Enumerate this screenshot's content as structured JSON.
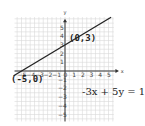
{
  "chart_data": {
    "type": "line",
    "title": "",
    "xlabel": "x",
    "ylabel": "y",
    "xlim": [
      -5,
      5
    ],
    "ylim": [
      -5,
      5
    ],
    "grid": true,
    "x_ticks": [
      -5,
      -4,
      -3,
      -2,
      -1,
      0,
      1,
      2,
      3,
      4,
      5
    ],
    "y_ticks": [
      -5,
      -4,
      -3,
      -2,
      -1,
      1,
      2,
      3,
      4,
      5
    ],
    "series": [
      {
        "name": "-3x + 5y = 15",
        "x": [
          -5,
          0,
          5
        ],
        "y": [
          0,
          3,
          6
        ]
      }
    ],
    "annotations": [
      {
        "text": "(0,3)",
        "x": 0,
        "y": 3
      },
      {
        "text": "(-5,0)",
        "x": -5,
        "y": 0
      },
      {
        "text": "-3x + 5y  =  15"
      }
    ]
  },
  "labels": {
    "equation": "-3x + 5y  =  15",
    "point_y_intercept": "(0,3)",
    "point_x_intercept": "(-5,0)",
    "x_axis": "x",
    "y_axis": "y"
  },
  "colors": {
    "line": "#222222",
    "grid": "#d8d8d8",
    "axis": "#333333"
  }
}
